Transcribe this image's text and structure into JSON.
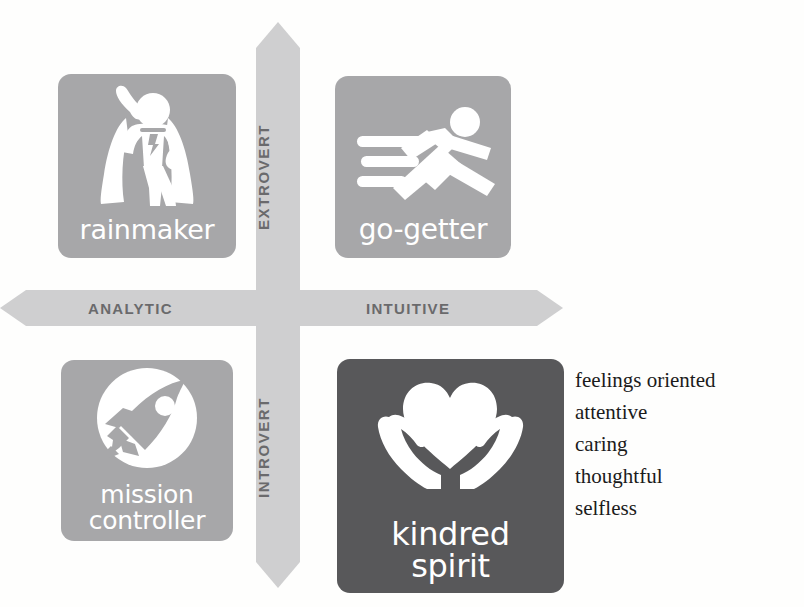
{
  "diagram": {
    "colors": {
      "tile_light": "#a7a7a9",
      "tile_dark": "#58585a",
      "axis": "#cfcfd0",
      "axis_label": "#6a6a6c",
      "page_background": "#fefefd",
      "trait_text": "#1b1b1b"
    }
  },
  "axes": {
    "horizontal": {
      "left_label": "ANALYTIC",
      "right_label": "INTUITIVE",
      "arrow_style": "double-headed",
      "icon": "double-arrow-horizontal-icon"
    },
    "vertical": {
      "top_label": "EXTROVERT",
      "bottom_label": "INTROVERT",
      "arrow_style": "double-headed",
      "icon": "double-arrow-vertical-icon"
    }
  },
  "quadrants": [
    {
      "key": "rainmaker",
      "caption": "rainmaker",
      "icon": "superhero-icon",
      "position": "top-left",
      "axis_combination": "ANALYTIC + EXTROVERT",
      "highlighted": false,
      "fill": "#a7a7a9"
    },
    {
      "key": "go-getter",
      "caption": "go-getter",
      "icon": "running-person-icon",
      "position": "top-right",
      "axis_combination": "INTUITIVE + EXTROVERT",
      "highlighted": false,
      "fill": "#a7a7a9"
    },
    {
      "key": "mission-controller",
      "caption": "mission\ncontroller",
      "caption_line1": "mission",
      "caption_line2": "controller",
      "icon": "rocket-in-circle-icon",
      "position": "bottom-left",
      "axis_combination": "ANALYTIC + INTROVERT",
      "highlighted": false,
      "fill": "#a7a7a9"
    },
    {
      "key": "kindred-spirit",
      "caption": "kindred\nspirit",
      "caption_line1": "kindred",
      "caption_line2": "spirit",
      "icon": "heart-in-hands-icon",
      "position": "bottom-right",
      "axis_combination": "INTUITIVE + INTROVERT",
      "highlighted": true,
      "fill": "#58585a"
    }
  ],
  "traits": {
    "belongs_to": "kindred-spirit",
    "items": [
      "feelings oriented",
      "attentive",
      "caring",
      "thoughtful",
      "selfless"
    ]
  }
}
